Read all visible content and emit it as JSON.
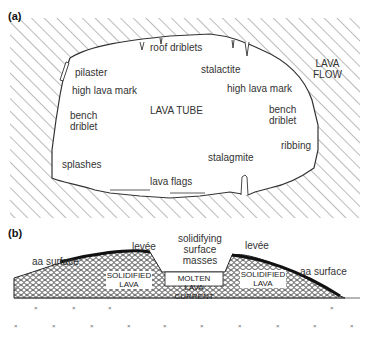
{
  "panel_a": {
    "tag": "(a)",
    "labels": {
      "roof_driblets": "roof driblets",
      "pilaster": "pilaster",
      "high_lava_mark_left": "high lava mark",
      "stalactite": "stalactite",
      "high_lava_mark_right": "high lava mark",
      "lava_flow_1": "LAVA",
      "lava_flow_2": "FLOW",
      "lava_tube": "LAVA TUBE",
      "bench_left_1": "bench",
      "bench_left_2": "driblet",
      "bench_right_1": "bench",
      "bench_right_2": "driblet",
      "ribbing": "ribbing",
      "splashes": "splashes",
      "stalagmite": "stalagmite",
      "lava_flags": "lava flags"
    }
  },
  "panel_b": {
    "tag": "(b)",
    "labels": {
      "aa_surface_left": "aa surface",
      "levee_left": "levée",
      "solidifying_1": "solidifying",
      "solidifying_2": "surface",
      "solidifying_3": "masses",
      "levee_right": "levée",
      "aa_surface_right": "aa surface",
      "solidified_left_1": "SOLIDIFIED",
      "solidified_left_2": "LAVA",
      "molten_1": "MOLTEN LAVA",
      "molten_2": "CURRENT",
      "solidified_right_1": "SOLIDIFIED",
      "solidified_right_2": "LAVA"
    }
  }
}
